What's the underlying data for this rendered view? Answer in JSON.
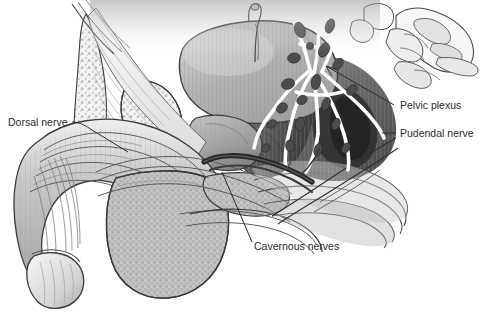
{
  "figure": {
    "background_color": "#ffffff",
    "ink_color": "#2b2b2b",
    "style": "grayscale medical line illustration"
  },
  "labels": {
    "dorsal_nerve": "Dorsal nerve",
    "pelvic_plexus": "Pelvic plexus",
    "pudendal_nerve": "Pudendal nerve",
    "cavernous_nerves": "Cavernous nerves"
  },
  "structures": {
    "bladder": "bladder",
    "prostate": "prostate",
    "pubic_bone": "pubic-bone",
    "sacrum": "sacrum",
    "penis_shaft": "penis-shaft",
    "glans": "glans-penis",
    "scrotum": "scrotum",
    "rectum": "rectum",
    "pelvic_floor": "pelvic-floor-muscle",
    "urethra": "urethra",
    "urachus": "urachus"
  },
  "palette": {
    "outline": "#3a3a3a",
    "light_gray": "#e8e8e8",
    "mid_gray": "#b8b8b8",
    "dark_gray": "#6f6f6f",
    "deep_gray": "#4a4a4a",
    "near_black": "#2a2a2a",
    "white": "#ffffff"
  }
}
